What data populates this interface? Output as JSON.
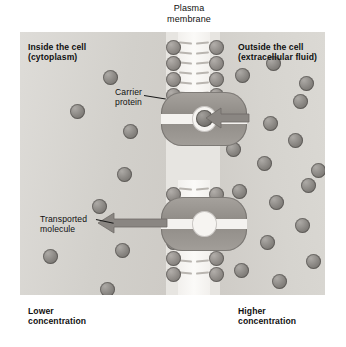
{
  "diagram": {
    "membrane_label": "Plasma\nmembrane",
    "inside_label": "Inside the cell\n(cytoplasm)",
    "outside_label": "Outside the cell\n(extracellular fluid)",
    "carrier_label": "Carrier\nprotein",
    "transported_label": "Transported\nmolecule",
    "lower_conc_label": "Lower\nconcentration",
    "higher_conc_label": "Higher\nconcentration"
  },
  "colors": {
    "panel_background": "#d7d6d2",
    "membrane_background": "#e7e5e1",
    "molecule_fill": "#878480",
    "protein_fill": "#8d8984",
    "arrow_fill": "#8a8682",
    "text": "#101010"
  },
  "icons": {
    "arrow_upper": "arrow-left-icon",
    "arrow_lower": "arrow-left-icon",
    "bracket": "bracket-icon"
  },
  "chart_data": {
    "type": "diagram",
    "concentration_gradient": {
      "left_side": "Lower concentration",
      "right_side": "Higher concentration",
      "direction": "outside to inside"
    }
  },
  "molecules_inside": [
    {
      "x": 83,
      "y": 38
    },
    {
      "x": 50,
      "y": 72
    },
    {
      "x": 97,
      "y": 135
    },
    {
      "x": 72,
      "y": 167
    },
    {
      "x": 95,
      "y": 211
    },
    {
      "x": 23,
      "y": 217
    },
    {
      "x": 80,
      "y": 250
    },
    {
      "x": 103,
      "y": 92
    }
  ],
  "molecules_outside": [
    {
      "x": 215,
      "y": 36
    },
    {
      "x": 246,
      "y": 24
    },
    {
      "x": 279,
      "y": 44
    },
    {
      "x": 209,
      "y": 71
    },
    {
      "x": 243,
      "y": 84
    },
    {
      "x": 273,
      "y": 62
    },
    {
      "x": 206,
      "y": 110
    },
    {
      "x": 237,
      "y": 124
    },
    {
      "x": 268,
      "y": 101
    },
    {
      "x": 291,
      "y": 131
    },
    {
      "x": 212,
      "y": 152
    },
    {
      "x": 249,
      "y": 163
    },
    {
      "x": 281,
      "y": 146
    },
    {
      "x": 205,
      "y": 192
    },
    {
      "x": 240,
      "y": 203
    },
    {
      "x": 275,
      "y": 186
    },
    {
      "x": 214,
      "y": 231
    },
    {
      "x": 252,
      "y": 242
    },
    {
      "x": 286,
      "y": 222
    },
    {
      "x": 224,
      "y": 266
    },
    {
      "x": 265,
      "y": 275
    }
  ],
  "bilayer": {
    "head_rows_top": [
      8,
      24,
      40,
      56
    ],
    "head_rows_bottom": [
      155,
      171,
      187,
      203,
      219,
      235
    ],
    "left_col_x": 146,
    "right_col_x": 189
  },
  "transported_molecule_marker": {
    "x": 95,
    "y": 211
  },
  "incoming_molecule_marker": {
    "x": 215,
    "y": 36
  }
}
